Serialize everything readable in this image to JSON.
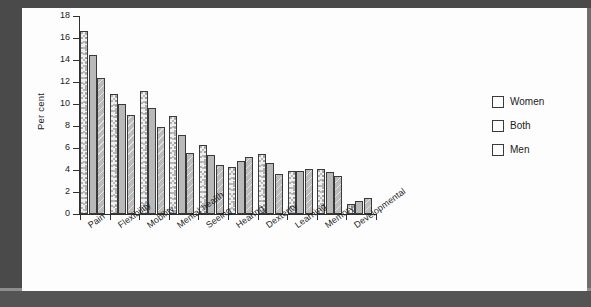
{
  "chart_data": {
    "type": "bar",
    "title": "",
    "subtitle": "",
    "xlabel": "",
    "ylabel": "Per cent",
    "ylim": [
      0,
      18
    ],
    "ytick_step": 2,
    "yticks": [
      0,
      2,
      4,
      6,
      8,
      10,
      12,
      14,
      16,
      18
    ],
    "grid": false,
    "legend_position": "right",
    "categories": [
      "Pain",
      "Flexibility",
      "Mobility",
      "Mental health",
      "Seeing",
      "Hearing",
      "Dexterity",
      "Learning",
      "Memory",
      "Developmental"
    ],
    "series": [
      {
        "name": "Women",
        "pattern": "speckled-dots",
        "color": "#efefef",
        "values": [
          16.6,
          10.9,
          11.2,
          8.9,
          6.3,
          4.3,
          5.5,
          3.9,
          4.1,
          0.9
        ]
      },
      {
        "name": "Both",
        "pattern": "solid-grey",
        "color": "#b9b9b9",
        "values": [
          14.5,
          10.0,
          9.6,
          7.2,
          5.4,
          4.8,
          4.6,
          3.9,
          3.85,
          1.15
        ]
      },
      {
        "name": "Men",
        "pattern": "diagonal-hatch",
        "color": "#bcbcbc",
        "values": [
          12.4,
          9.0,
          7.9,
          5.55,
          4.5,
          5.2,
          3.6,
          4.05,
          3.5,
          1.45
        ]
      }
    ]
  },
  "legend": {
    "items": [
      {
        "label": "Women"
      },
      {
        "label": "Both"
      },
      {
        "label": "Men"
      }
    ]
  },
  "colors": {
    "axis": "#2f2f2f",
    "text": "#1c1c1c",
    "scan_border": "#4a4a4a",
    "paper": "#fdfdfd"
  }
}
